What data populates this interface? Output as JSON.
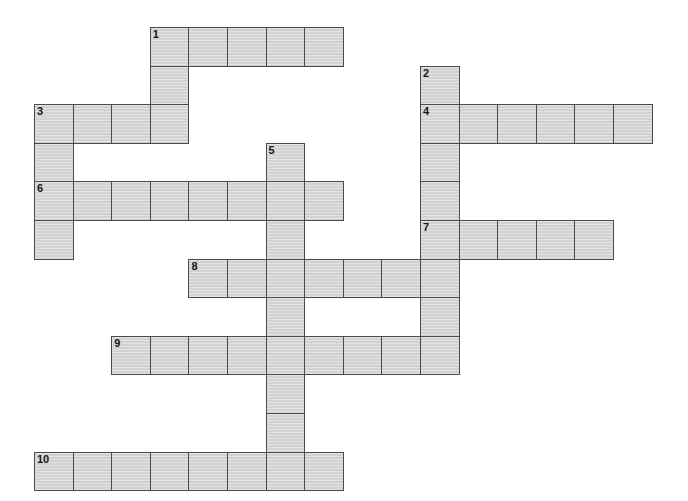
{
  "puzzle": {
    "title": "Crossword Grid",
    "type": "crossword-grid",
    "grid_geometry": {
      "origin_x": 34,
      "origin_y": 27,
      "cell_size": 38.6,
      "columns": 17,
      "rows": 12
    },
    "colors": {
      "cell_fill": "#d2d2d2",
      "cell_border": "#4a4a4a",
      "number_text": "#171717",
      "background": "#ffffff"
    },
    "entries": [
      {
        "number": "1",
        "direction": "across",
        "row": 0,
        "col": 3,
        "length": 5
      },
      {
        "number": "1",
        "direction": "down",
        "row": 0,
        "col": 3,
        "length": 4
      },
      {
        "number": "2",
        "direction": "down",
        "row": 1,
        "col": 10,
        "length": 5
      },
      {
        "number": "3",
        "direction": "across",
        "row": 2,
        "col": 0,
        "length": 4
      },
      {
        "number": "3",
        "direction": "down",
        "row": 2,
        "col": 0,
        "length": 4
      },
      {
        "number": "4",
        "direction": "across",
        "row": 2,
        "col": 10,
        "length": 6
      },
      {
        "number": "5",
        "direction": "down",
        "row": 3,
        "col": 6,
        "length": 9
      },
      {
        "number": "6",
        "direction": "across",
        "row": 4,
        "col": 0,
        "length": 8
      },
      {
        "number": "7",
        "direction": "across",
        "row": 5,
        "col": 10,
        "length": 5
      },
      {
        "number": "8",
        "direction": "across",
        "row": 6,
        "col": 4,
        "length": 7
      },
      {
        "number": "9",
        "direction": "across",
        "row": 8,
        "col": 2,
        "length": 9
      },
      {
        "number": "10",
        "direction": "across",
        "row": 11,
        "col": 0,
        "length": 8
      }
    ],
    "cells": [
      {
        "row": 0,
        "col": 3,
        "number": "1"
      },
      {
        "row": 0,
        "col": 4,
        "number": ""
      },
      {
        "row": 0,
        "col": 5,
        "number": ""
      },
      {
        "row": 0,
        "col": 6,
        "number": ""
      },
      {
        "row": 0,
        "col": 7,
        "number": ""
      },
      {
        "row": 1,
        "col": 3,
        "number": ""
      },
      {
        "row": 1,
        "col": 10,
        "number": "2"
      },
      {
        "row": 2,
        "col": 0,
        "number": "3"
      },
      {
        "row": 2,
        "col": 1,
        "number": ""
      },
      {
        "row": 2,
        "col": 2,
        "number": ""
      },
      {
        "row": 2,
        "col": 3,
        "number": ""
      },
      {
        "row": 2,
        "col": 10,
        "number": "4"
      },
      {
        "row": 2,
        "col": 11,
        "number": ""
      },
      {
        "row": 2,
        "col": 12,
        "number": ""
      },
      {
        "row": 2,
        "col": 13,
        "number": ""
      },
      {
        "row": 2,
        "col": 14,
        "number": ""
      },
      {
        "row": 2,
        "col": 15,
        "number": ""
      },
      {
        "row": 3,
        "col": 0,
        "number": ""
      },
      {
        "row": 3,
        "col": 6,
        "number": "5"
      },
      {
        "row": 3,
        "col": 10,
        "number": ""
      },
      {
        "row": 4,
        "col": 0,
        "number": "6"
      },
      {
        "row": 4,
        "col": 1,
        "number": ""
      },
      {
        "row": 4,
        "col": 2,
        "number": ""
      },
      {
        "row": 4,
        "col": 3,
        "number": ""
      },
      {
        "row": 4,
        "col": 4,
        "number": ""
      },
      {
        "row": 4,
        "col": 5,
        "number": ""
      },
      {
        "row": 4,
        "col": 6,
        "number": ""
      },
      {
        "row": 4,
        "col": 7,
        "number": ""
      },
      {
        "row": 4,
        "col": 10,
        "number": ""
      },
      {
        "row": 5,
        "col": 0,
        "number": ""
      },
      {
        "row": 5,
        "col": 6,
        "number": ""
      },
      {
        "row": 5,
        "col": 10,
        "number": "7"
      },
      {
        "row": 5,
        "col": 11,
        "number": ""
      },
      {
        "row": 5,
        "col": 12,
        "number": ""
      },
      {
        "row": 5,
        "col": 13,
        "number": ""
      },
      {
        "row": 5,
        "col": 14,
        "number": ""
      },
      {
        "row": 6,
        "col": 4,
        "number": "8"
      },
      {
        "row": 6,
        "col": 5,
        "number": ""
      },
      {
        "row": 6,
        "col": 6,
        "number": ""
      },
      {
        "row": 6,
        "col": 7,
        "number": ""
      },
      {
        "row": 6,
        "col": 8,
        "number": ""
      },
      {
        "row": 6,
        "col": 9,
        "number": ""
      },
      {
        "row": 6,
        "col": 10,
        "number": ""
      },
      {
        "row": 7,
        "col": 6,
        "number": ""
      },
      {
        "row": 7,
        "col": 10,
        "number": ""
      },
      {
        "row": 8,
        "col": 2,
        "number": "9"
      },
      {
        "row": 8,
        "col": 3,
        "number": ""
      },
      {
        "row": 8,
        "col": 4,
        "number": ""
      },
      {
        "row": 8,
        "col": 5,
        "number": ""
      },
      {
        "row": 8,
        "col": 6,
        "number": ""
      },
      {
        "row": 8,
        "col": 7,
        "number": ""
      },
      {
        "row": 8,
        "col": 8,
        "number": ""
      },
      {
        "row": 8,
        "col": 9,
        "number": ""
      },
      {
        "row": 8,
        "col": 10,
        "number": ""
      },
      {
        "row": 9,
        "col": 6,
        "number": ""
      },
      {
        "row": 10,
        "col": 6,
        "number": ""
      },
      {
        "row": 11,
        "col": 0,
        "number": "10"
      },
      {
        "row": 11,
        "col": 1,
        "number": ""
      },
      {
        "row": 11,
        "col": 2,
        "number": ""
      },
      {
        "row": 11,
        "col": 3,
        "number": ""
      },
      {
        "row": 11,
        "col": 4,
        "number": ""
      },
      {
        "row": 11,
        "col": 5,
        "number": ""
      },
      {
        "row": 11,
        "col": 6,
        "number": ""
      },
      {
        "row": 11,
        "col": 7,
        "number": ""
      }
    ]
  }
}
